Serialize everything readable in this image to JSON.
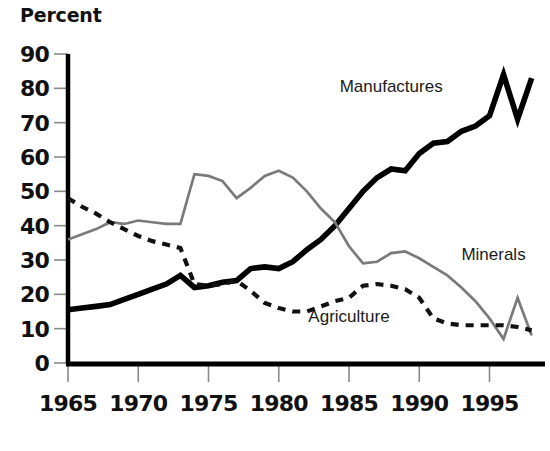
{
  "chart_data": {
    "type": "line",
    "title": "Percent",
    "xlabel": "",
    "ylabel": "Percent",
    "xlim": [
      1965,
      1998
    ],
    "ylim": [
      0,
      90
    ],
    "grid": false,
    "legend_position": "inline-annotations",
    "y_ticks": [
      0,
      10,
      20,
      30,
      40,
      50,
      60,
      70,
      80,
      90
    ],
    "x_ticks": [
      1965,
      1970,
      1975,
      1980,
      1985,
      1990,
      1995
    ],
    "x": [
      1965,
      1966,
      1967,
      1968,
      1969,
      1970,
      1971,
      1972,
      1973,
      1974,
      1975,
      1976,
      1977,
      1978,
      1979,
      1980,
      1981,
      1982,
      1983,
      1984,
      1985,
      1986,
      1987,
      1988,
      1989,
      1990,
      1991,
      1992,
      1993,
      1994,
      1995,
      1996,
      1997,
      1998
    ],
    "series": [
      {
        "name": "Manufactures",
        "style": "solid-thick-black",
        "color": "#000000",
        "label_x": 1988,
        "label_y": 79,
        "values": [
          15.5,
          16.0,
          16.5,
          17.0,
          18.5,
          20.0,
          21.5,
          23.0,
          25.5,
          22.0,
          22.5,
          23.5,
          24.0,
          27.5,
          28.0,
          27.5,
          29.5,
          33.0,
          36.0,
          40.0,
          45.0,
          50.0,
          54.0,
          56.5,
          56.0,
          61.0,
          64.0,
          64.5,
          67.5,
          69.0,
          72.0,
          84.0,
          71.0,
          83.0
        ]
      },
      {
        "name": "Minerals",
        "style": "solid-thin-gray",
        "color": "#7a7a7a",
        "label_x": 1993,
        "label_y": 30,
        "values": [
          36.0,
          37.5,
          39.0,
          41.0,
          40.5,
          41.5,
          41.0,
          40.5,
          40.5,
          55.0,
          54.5,
          53.0,
          48.0,
          51.0,
          54.5,
          56.0,
          54.0,
          50.0,
          45.0,
          41.0,
          34.0,
          29.0,
          29.5,
          32.0,
          32.5,
          30.5,
          28.0,
          25.5,
          22.0,
          18.0,
          13.0,
          7.0,
          19.0,
          8.0
        ]
      },
      {
        "name": "Agriculture",
        "style": "dashed-black",
        "color": "#111111",
        "label_x": 1985,
        "label_y": 12,
        "values": [
          48.0,
          45.5,
          43.5,
          41.0,
          39.0,
          37.0,
          35.5,
          34.5,
          33.5,
          23.0,
          22.5,
          23.0,
          24.0,
          21.0,
          17.5,
          16.0,
          15.0,
          15.0,
          16.5,
          18.0,
          19.0,
          22.5,
          23.0,
          22.5,
          21.5,
          19.0,
          13.0,
          11.5,
          11.0,
          11.0,
          11.0,
          11.0,
          10.5,
          9.5
        ]
      }
    ]
  },
  "labels": {
    "y_axis_title": "Percent",
    "manufactures": "Manufactures",
    "minerals": "Minerals",
    "agriculture": "Agriculture"
  }
}
